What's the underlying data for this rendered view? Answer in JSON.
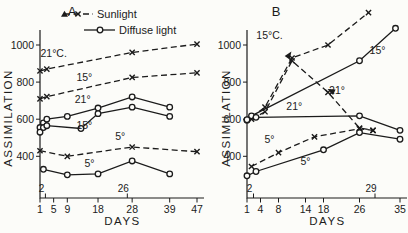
{
  "figure": {
    "background": "#fcfcf9",
    "ink": "#1b1b1b",
    "panels": [
      "A",
      "B"
    ]
  },
  "legend": {
    "items": [
      {
        "label": "Sunlight",
        "line": "dashed",
        "marker": "x",
        "start_glyph": "triangle-icon"
      },
      {
        "label": "Diffuse light",
        "line": "solid",
        "marker": "circle"
      }
    ]
  },
  "chart_data": [
    {
      "panel": "A",
      "type": "line",
      "title": "",
      "xlabel": "DAYS",
      "ylabel": "ASSIMILATION",
      "xlim": [
        1,
        47
      ],
      "ylim": [
        200,
        1100
      ],
      "xticks": [
        1,
        5,
        9,
        18,
        28,
        39,
        47
      ],
      "yticks": [
        400,
        600,
        800,
        1000
      ],
      "grid": false,
      "event_marks": [
        {
          "day": 2,
          "label": "2"
        },
        {
          "day": 26,
          "label": "26"
        }
      ],
      "series": [
        {
          "name": "sunlight-21c",
          "legend": "Sunlight",
          "temp_label": "21°C.",
          "line": "dashed",
          "marker": "x",
          "x": [
            1,
            3,
            28,
            47
          ],
          "y": [
            860,
            870,
            960,
            1005
          ],
          "label_day": 5,
          "label_value": 935
        },
        {
          "name": "sunlight-15",
          "legend": "Sunlight",
          "temp_label": "15°",
          "line": "dashed",
          "marker": "x",
          "x": [
            1,
            3,
            28,
            47
          ],
          "y": [
            710,
            722,
            825,
            850
          ],
          "label_day": 14,
          "label_value": 805
        },
        {
          "name": "diffuse-21",
          "legend": "Diffuse light",
          "temp_label": "21°",
          "line": "solid",
          "marker": "o",
          "x": [
            1,
            2,
            3,
            9,
            18,
            28,
            39
          ],
          "y": [
            555,
            580,
            600,
            615,
            660,
            720,
            665
          ],
          "label_day": 13.5,
          "label_value": 690
        },
        {
          "name": "diffuse-15",
          "legend": "Diffuse light",
          "temp_label": "15°",
          "line": "solid",
          "marker": "o",
          "x": [
            1,
            2,
            3,
            13,
            18,
            28,
            39
          ],
          "y": [
            530,
            555,
            565,
            550,
            630,
            665,
            615
          ],
          "label_day": 14,
          "label_value": 545
        },
        {
          "name": "sunlight-5",
          "legend": "Sunlight",
          "temp_label": "5°",
          "line": "dashed",
          "marker": "x",
          "x": [
            1,
            9,
            28,
            47
          ],
          "y": [
            430,
            400,
            450,
            425
          ],
          "label_day": 24.5,
          "label_value": 487
        },
        {
          "name": "diffuse-5",
          "legend": "Diffuse light",
          "temp_label": "5°",
          "line": "solid",
          "marker": "o",
          "x": [
            2,
            9,
            18,
            28,
            39
          ],
          "y": [
            330,
            300,
            305,
            375,
            305
          ],
          "label_day": 15.5,
          "label_value": 340
        }
      ],
      "pointers": []
    },
    {
      "panel": "B",
      "type": "line",
      "title": "",
      "xlabel": "DAYS",
      "ylabel": "ASSIMILATION",
      "xlim": [
        1,
        35
      ],
      "ylim": [
        200,
        1200
      ],
      "xticks": [
        1,
        4,
        8,
        14,
        18,
        26,
        35
      ],
      "yticks": [
        400,
        600,
        800,
        1000
      ],
      "grid": false,
      "event_marks": [
        {
          "day": 2,
          "label": "2"
        },
        {
          "day": 29,
          "label": "29"
        }
      ],
      "series": [
        {
          "name": "sunlight-15c",
          "legend": "Sunlight",
          "temp_label": "15°C.",
          "line": "dashed",
          "marker": "x",
          "x": [
            2,
            5,
            11,
            19,
            28
          ],
          "y": [
            610,
            665,
            930,
            1000,
            1175
          ],
          "label_day": 6,
          "label_value": 1035
        },
        {
          "name": "sunlight-21",
          "legend": "Sunlight",
          "temp_label": "21°",
          "line": "dashed",
          "marker": "x",
          "x": [
            2,
            5,
            11,
            19,
            26,
            29
          ],
          "y": [
            600,
            640,
            915,
            745,
            552,
            540
          ],
          "label_day": 21,
          "label_value": 735
        },
        {
          "name": "diffuse-15",
          "legend": "Diffuse light",
          "temp_label": "15°",
          "line": "solid",
          "marker": "o",
          "x": [
            1,
            2,
            26,
            34
          ],
          "y": [
            595,
            618,
            915,
            1090
          ],
          "label_day": 30,
          "label_value": 950
        },
        {
          "name": "diffuse-21",
          "legend": "Diffuse light",
          "temp_label": "21°",
          "line": "solid",
          "marker": "o",
          "x": [
            1,
            3,
            26,
            35
          ],
          "y": [
            597,
            610,
            618,
            540
          ],
          "label_day": 11.5,
          "label_value": 650
        },
        {
          "name": "sunlight-5",
          "legend": "Sunlight",
          "temp_label": "5°",
          "line": "dashed",
          "marker": "x",
          "x": [
            2,
            8,
            16,
            26,
            29
          ],
          "y": [
            345,
            420,
            505,
            548,
            540
          ],
          "label_day": 6,
          "label_value": 470
        },
        {
          "name": "diffuse-5",
          "legend": "Diffuse light",
          "temp_label": "5°",
          "line": "solid",
          "marker": "o",
          "x": [
            1,
            3,
            18,
            26,
            35
          ],
          "y": [
            295,
            318,
            435,
            528,
            492
          ],
          "label_day": 14,
          "label_value": 352
        }
      ],
      "pointers": [
        {
          "day": 10.3,
          "value": 945,
          "rot": -55,
          "name": "label-pointer-15c"
        },
        {
          "day": 19.8,
          "value": 752,
          "rot": 205,
          "name": "label-pointer-21"
        }
      ]
    }
  ]
}
